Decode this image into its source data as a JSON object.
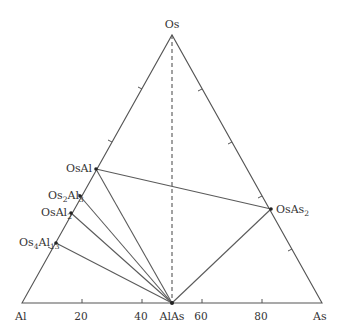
{
  "diagram": {
    "type": "ternary phase diagram",
    "vertices": {
      "top": "Os",
      "bottom_left": "Al",
      "bottom_right": "As"
    },
    "bottom_axis_ticks": [
      "20",
      "40",
      "60",
      "80"
    ],
    "compounds": [
      {
        "name": "OsAl",
        "base": "OsAl",
        "formula": "OsAl"
      },
      {
        "name": "Os2Al3",
        "parts": [
          "Os",
          "2",
          "Al",
          "3"
        ]
      },
      {
        "name": "OsAl2",
        "parts": [
          "OsAl",
          "2"
        ]
      },
      {
        "name": "Os4Al13",
        "parts": [
          "Os",
          "4",
          "Al",
          "13"
        ]
      },
      {
        "name": "OsAs2",
        "parts": [
          "OsAs",
          "2"
        ]
      },
      {
        "name": "AlAs",
        "formula": "AlAs"
      }
    ],
    "tie_lines": [
      [
        "OsAl",
        "OsAs2"
      ],
      [
        "OsAl",
        "AlAs"
      ],
      [
        "Os2Al3",
        "AlAs"
      ],
      [
        "OsAl2",
        "AlAs"
      ],
      [
        "Os4Al13",
        "AlAs"
      ],
      [
        "OsAs2",
        "AlAs"
      ]
    ],
    "dashed_lines": [
      [
        "Os",
        "AlAs"
      ]
    ],
    "colors": {
      "line": "#555555",
      "text": "#333333",
      "point": "#222222"
    }
  }
}
